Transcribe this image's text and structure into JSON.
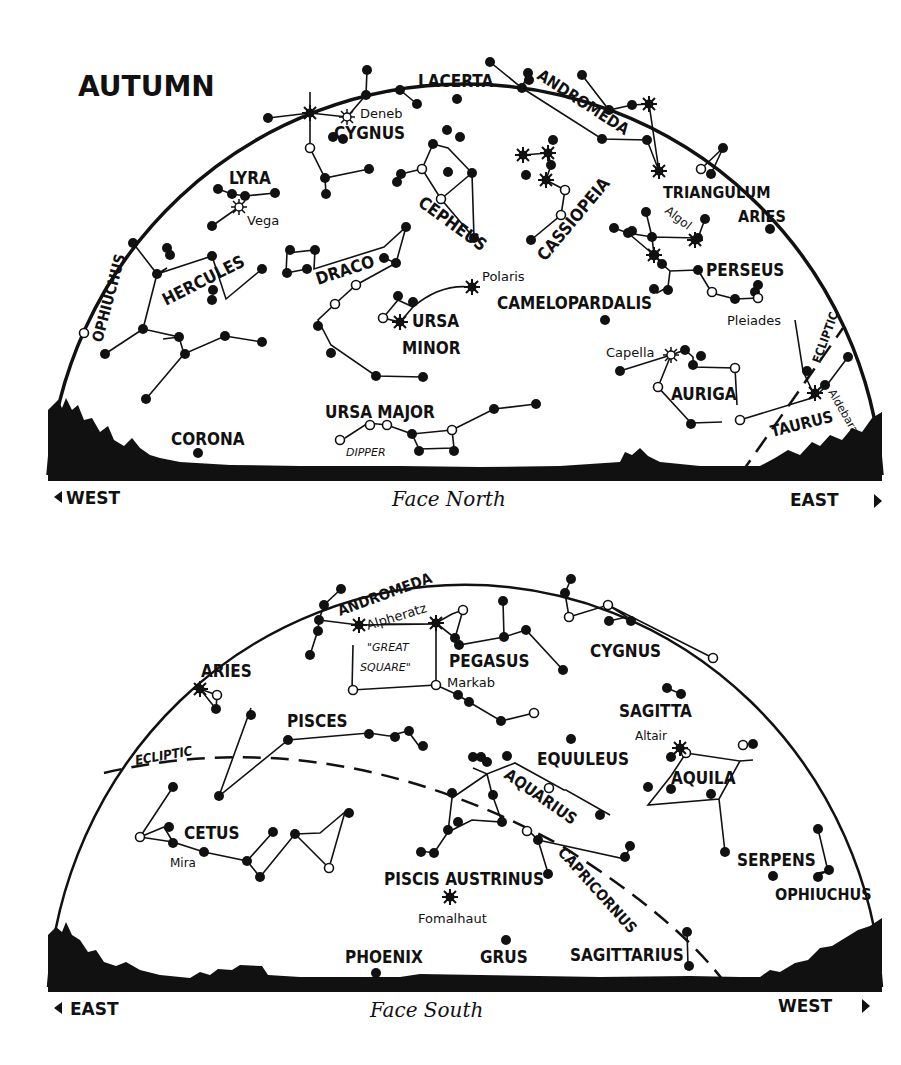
{
  "title": "AUTUMN",
  "north_chart": {
    "facing": "Face North",
    "left_dir": "WEST",
    "right_dir": "EAST",
    "constellations": [
      {
        "name": "LACERTA",
        "x": 418,
        "y": 87,
        "rot": 0,
        "size": 17
      },
      {
        "name": "ANDROMEDA",
        "x": 540,
        "y": 77,
        "rot": 33,
        "size": 16
      },
      {
        "name": "CYGNUS",
        "x": 334,
        "y": 139,
        "rot": 0,
        "size": 17
      },
      {
        "name": "LYRA",
        "x": 229,
        "y": 183,
        "rot": 0,
        "size": 17
      },
      {
        "name": "CEPHEUS",
        "x": 410,
        "y": 213,
        "rot": 36,
        "size": 17
      },
      {
        "name": "CASSIOPEIA",
        "x": 540,
        "y": 262,
        "rot": -50,
        "size": 17
      },
      {
        "name": "TRIANGULUM",
        "x": 663,
        "y": 200,
        "rot": 0,
        "size": 16
      },
      {
        "name": "ARIES",
        "x": 738,
        "y": 222,
        "rot": 0,
        "size": 16
      },
      {
        "name": "HERCULES",
        "x": 160,
        "y": 306,
        "rot": -27,
        "size": 17
      },
      {
        "name": "OPHIUCHUS",
        "x": 103,
        "y": 343,
        "rot": -75,
        "size": 15
      },
      {
        "name": "DRACO",
        "x": 318,
        "y": 283,
        "rot": -18,
        "size": 17
      },
      {
        "name": "PERSEUS",
        "x": 706,
        "y": 275,
        "rot": 0,
        "size": 17
      },
      {
        "name": "CAMELOPARDALIS",
        "x": 497,
        "y": 309,
        "rot": 0,
        "size": 17
      },
      {
        "name": "URSA",
        "x": 414,
        "y": 327,
        "rot": 0,
        "size": 17
      },
      {
        "name": "MINOR",
        "x": 402,
        "y": 353,
        "rot": 0,
        "size": 17
      },
      {
        "name": "AURIGA",
        "x": 671,
        "y": 400,
        "rot": 0,
        "size": 17
      },
      {
        "name": "ECLIPTIC",
        "x": 817,
        "y": 363,
        "rot": -70,
        "size": 12
      },
      {
        "name": "TAURUS",
        "x": 774,
        "y": 432,
        "rot": -14,
        "size": 16
      },
      {
        "name": "URSA MAJOR",
        "x": 325,
        "y": 417,
        "rot": 0,
        "size": 17
      },
      {
        "name": "CORONA",
        "x": 171,
        "y": 445,
        "rot": 0,
        "size": 17
      }
    ],
    "stars": [
      {
        "name": "Deneb",
        "x": 361,
        "y": 118,
        "rot": 0
      },
      {
        "name": "Vega",
        "x": 247,
        "y": 225,
        "rot": 0
      },
      {
        "name": "Algol",
        "x": 650,
        "y": 207,
        "rot": 38
      },
      {
        "name": "Polaris",
        "x": 482,
        "y": 278,
        "rot": 0
      },
      {
        "name": "Capella",
        "x": 606,
        "y": 357,
        "rot": 0
      },
      {
        "name": "Pleiades",
        "x": 727,
        "y": 327,
        "rot": 0
      },
      {
        "name": "Aldebaran",
        "x": 824,
        "y": 397,
        "rot": 60
      }
    ],
    "notes": [
      {
        "text": "DIPPER",
        "x": 346,
        "y": 456
      }
    ]
  },
  "south_chart": {
    "facing": "Face South",
    "left_dir": "EAST",
    "right_dir": "WEST",
    "constellations": [
      {
        "name": "ANDROMEDA",
        "x": 336,
        "y": 616,
        "rot": -20,
        "size": 15
      },
      {
        "name": "PEGASUS",
        "x": 449,
        "y": 667,
        "rot": 0,
        "size": 17
      },
      {
        "name": "CYGNUS",
        "x": 590,
        "y": 657,
        "rot": 0,
        "size": 17
      },
      {
        "name": "ARIES",
        "x": 201,
        "y": 677,
        "rot": 0,
        "size": 17
      },
      {
        "name": "SAGITTA",
        "x": 619,
        "y": 717,
        "rot": 0,
        "size": 17
      },
      {
        "name": "PISCES",
        "x": 287,
        "y": 725,
        "rot": 0,
        "size": 17
      },
      {
        "name": "ECLIPTIC",
        "x": 136,
        "y": 762,
        "rot": -10,
        "size": 13
      },
      {
        "name": "EQUULEUS",
        "x": 537,
        "y": 764,
        "rot": 0,
        "size": 17
      },
      {
        "name": "AQUILA",
        "x": 671,
        "y": 784,
        "rot": 0,
        "size": 17
      },
      {
        "name": "AQUARIUS",
        "x": 500,
        "y": 770,
        "rot": 35,
        "size": 16
      },
      {
        "name": "CETUS",
        "x": 184,
        "y": 838,
        "rot": 0,
        "size": 17
      },
      {
        "name": "CAPRICORNUS",
        "x": 555,
        "y": 848,
        "rot": 48,
        "size": 15
      },
      {
        "name": "SERPENS",
        "x": 737,
        "y": 866,
        "rot": 0,
        "size": 17
      },
      {
        "name": "OPHIUCHUS",
        "x": 775,
        "y": 899,
        "rot": 0,
        "size": 16
      },
      {
        "name": "PISCIS AUSTRINUS",
        "x": 384,
        "y": 884,
        "rot": 0,
        "size": 17
      },
      {
        "name": "SAGITTARIUS",
        "x": 570,
        "y": 961,
        "rot": 0,
        "size": 17
      },
      {
        "name": "PHOENIX",
        "x": 345,
        "y": 962,
        "rot": 0,
        "size": 17
      },
      {
        "name": "GRUS",
        "x": 480,
        "y": 962,
        "rot": 0,
        "size": 17
      }
    ],
    "stars": [
      {
        "name": "Alpheratz",
        "x": 368,
        "y": 629,
        "rot": -17
      },
      {
        "name": "Markab",
        "x": 447,
        "y": 688,
        "rot": 0
      },
      {
        "name": "Altair",
        "x": 635,
        "y": 741,
        "rot": 0
      },
      {
        "name": "Mira",
        "x": 170,
        "y": 866,
        "rot": 0
      },
      {
        "name": "Fomalhaut",
        "x": 418,
        "y": 922,
        "rot": 0
      }
    ],
    "notes": [
      {
        "text": "\"GREAT",
        "x": 367,
        "y": 652
      },
      {
        "text": "SQUARE\"",
        "x": 360,
        "y": 672
      }
    ]
  }
}
